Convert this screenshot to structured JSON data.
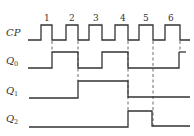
{
  "diagram": {
    "type": "timing-diagram",
    "signals": [
      {
        "label": "CP",
        "sub": ""
      },
      {
        "label": "Q",
        "sub": "0"
      },
      {
        "label": "Q",
        "sub": "1"
      },
      {
        "label": "Q",
        "sub": "2"
      }
    ],
    "pulse_numbers": [
      "1",
      "2",
      "3",
      "4",
      "5",
      "6"
    ],
    "waveforms": {
      "CP": "0,1,0,1,0,1,0,1,0,1,0,1,0",
      "Q0": "0 | 1 (after pulse 1) | 0 (after pulse 2) | 1 (after pulse 3) | 0 (after pulse 4) | 0 (after pulse 5) | 1 (after pulse 6)",
      "Q1": "0 | 1 (after pulse 2) | 0 (after pulse 4)",
      "Q2": "0 | 1 (after pulse 4) | 0 (after pulse 5)"
    },
    "stroke_color": "#333333"
  }
}
